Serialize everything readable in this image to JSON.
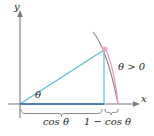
{
  "figure": {
    "axes": {
      "x_label": "x",
      "y_label": "y"
    },
    "labels": {
      "angle_theta": "θ",
      "theta_positive": "θ > 0",
      "brace_left": "cos θ",
      "brace_right": "1 − cos θ"
    },
    "colors": {
      "axis": "#6d6e71",
      "triangle": "#5bbfd6",
      "baseline": "#2e6ea6",
      "arc": "#e8a0bd",
      "curve": "#9a8b86",
      "brace": "#6d6e71",
      "point": "#e8a0bd",
      "text": "#231f20"
    },
    "geometry": {
      "origin": [
        20,
        104
      ],
      "vertex": [
        104,
        50
      ],
      "foot": [
        104,
        104
      ],
      "arc_end": [
        118,
        104
      ],
      "x_axis_end": [
        139,
        104
      ],
      "y_axis_top": [
        20,
        14
      ]
    }
  }
}
